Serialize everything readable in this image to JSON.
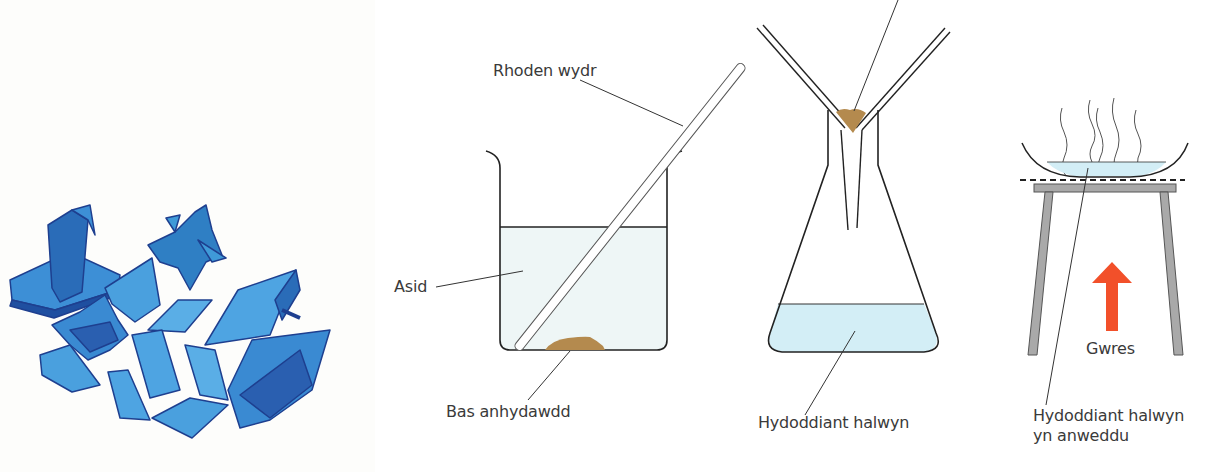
{
  "figure": {
    "panels": [
      {
        "id": "crystals",
        "description": "Photograph of blue copper sulfate crystals",
        "colors": {
          "crystal_light": "#3f9ad8",
          "crystal_mid": "#2f7fc4",
          "crystal_dark": "#1f4fa0"
        }
      },
      {
        "id": "beaker",
        "labels": {
          "glass_rod": "Rhoden wydr",
          "acid": "Asid",
          "insoluble_base": "Bas anhydawdd"
        },
        "colors": {
          "liquid": "#eef6f6",
          "solid": "#b48a4e"
        }
      },
      {
        "id": "filtration",
        "labels": {
          "salt_solution": "Hydoddiant halwyn"
        },
        "colors": {
          "filtrate": "#d3eef6",
          "residue": "#b48a4e"
        }
      },
      {
        "id": "evaporation",
        "labels": {
          "heat": "Gwres",
          "evaporating_solution_line1": "Hydoddiant halwyn",
          "evaporating_solution_line2": "yn anweddu"
        },
        "colors": {
          "liquid": "#d3eef6",
          "tripod": "#a9a9a9",
          "heat_arrow": "#f2502a"
        }
      }
    ]
  }
}
